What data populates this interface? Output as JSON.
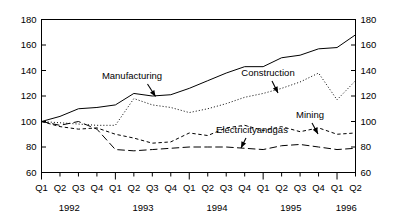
{
  "chart_data": {
    "type": "line",
    "title": "",
    "xlabel": "",
    "ylabel": "",
    "ylim": [
      60,
      180
    ],
    "yticks": [
      60,
      80,
      100,
      120,
      140,
      160,
      180
    ],
    "grid": false,
    "legend": "annotations-inline",
    "dual_y_axis": true,
    "x": [
      "Q1",
      "Q2",
      "Q3",
      "Q4",
      "Q1",
      "Q2",
      "Q3",
      "Q4",
      "Q1",
      "Q2",
      "Q3",
      "Q4",
      "Q1",
      "Q2",
      "Q3",
      "Q4",
      "Q1",
      "Q2"
    ],
    "year_groups": [
      {
        "label": "1992",
        "quarters": [
          "Q1",
          "Q2",
          "Q3",
          "Q4"
        ]
      },
      {
        "label": "1993",
        "quarters": [
          "Q1",
          "Q2",
          "Q3",
          "Q4"
        ]
      },
      {
        "label": "1994",
        "quarters": [
          "Q1",
          "Q2",
          "Q3",
          "Q4"
        ]
      },
      {
        "label": "1995",
        "quarters": [
          "Q1",
          "Q2",
          "Q3",
          "Q4"
        ]
      },
      {
        "label": "1996",
        "quarters": [
          "Q1",
          "Q2"
        ]
      }
    ],
    "series": [
      {
        "name": "Manufacturing",
        "style": "solid",
        "values": [
          100,
          104,
          110,
          111,
          113,
          122,
          120,
          121,
          126,
          132,
          138,
          143,
          143,
          150,
          152,
          157,
          158,
          168
        ]
      },
      {
        "name": "Construction",
        "style": "dotted",
        "values": [
          100,
          99,
          98,
          97,
          97,
          118,
          113,
          111,
          107,
          110,
          114,
          119,
          122,
          126,
          131,
          138,
          117,
          132
        ]
      },
      {
        "name": "Mining",
        "style": "dashed-short",
        "values": [
          100,
          96,
          94,
          95,
          90,
          87,
          83,
          84,
          91,
          89,
          95,
          97,
          93,
          96,
          92,
          95,
          90,
          91
        ]
      },
      {
        "name": "Electricityandgas",
        "style": "dashed-long",
        "values": [
          100,
          97,
          100,
          94,
          78,
          77,
          78,
          79,
          80,
          80,
          80,
          79,
          78,
          81,
          82,
          80,
          78,
          79
        ]
      }
    ],
    "annotations": [
      {
        "label": "Manufacturing",
        "target_series": "Manufacturing",
        "target_point": "1993 Q2"
      },
      {
        "label": "Construction",
        "target_series": "Construction",
        "target_point": "1995 Q2"
      },
      {
        "label": "Mining",
        "target_series": "Mining",
        "target_point": "1995 Q2"
      },
      {
        "label": "Electricityandgas",
        "target_series": "Electricityandgas",
        "target_point": "1994 Q4"
      }
    ],
    "axis_labels_left": [
      "180",
      "160",
      "140",
      "120",
      "100",
      "80",
      "60"
    ],
    "axis_labels_right": [
      "180",
      "160",
      "140",
      "120",
      "100",
      "80",
      "60"
    ],
    "colors": {
      "line": "#000000",
      "background": "#ffffff",
      "axis": "#000000"
    }
  }
}
